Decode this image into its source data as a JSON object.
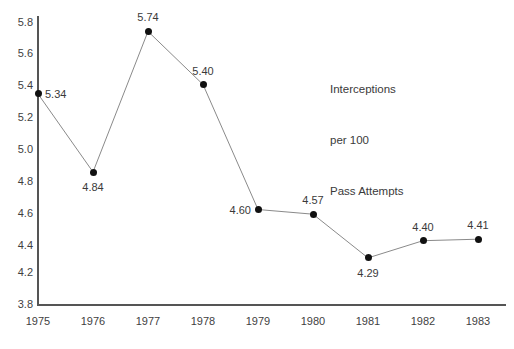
{
  "chart_data": {
    "type": "line",
    "title": "",
    "xlabel": "",
    "ylabel": "",
    "categories": [
      "1975",
      "1976",
      "1977",
      "1978",
      "1979",
      "1980",
      "1981",
      "1982",
      "1983"
    ],
    "values": [
      5.34,
      4.84,
      5.74,
      5.4,
      4.6,
      4.57,
      4.29,
      4.4,
      4.41
    ],
    "point_labels": [
      "5.34",
      "4.84",
      "5.74",
      "5.40",
      "4.60",
      "4.57",
      "4.29",
      "4.40",
      "4.41"
    ],
    "label_positions": [
      "right",
      "below",
      "above",
      "above",
      "left",
      "above",
      "below",
      "above",
      "above"
    ],
    "ylim": [
      3.8,
      5.8
    ],
    "ytick_labels": [
      "5.8",
      "5.6",
      "5.4",
      "5.2",
      "5.0",
      "4.8",
      "4.6",
      "4.4",
      "4.2",
      "3.8"
    ],
    "xtick_labels": [
      "1975",
      "1976",
      "1977",
      "1978",
      "1979",
      "1980",
      "1981",
      "1982",
      "1983"
    ],
    "grid": false,
    "legend": "none",
    "annotation": {
      "line1": "Interceptions",
      "line2": "per 100",
      "line3": "Pass Attempts"
    },
    "colors": {
      "line": "#8a8a8a",
      "marker": "#111111",
      "axis": "#555555",
      "text": "#3a3a3a",
      "background": "#ffffff"
    }
  }
}
